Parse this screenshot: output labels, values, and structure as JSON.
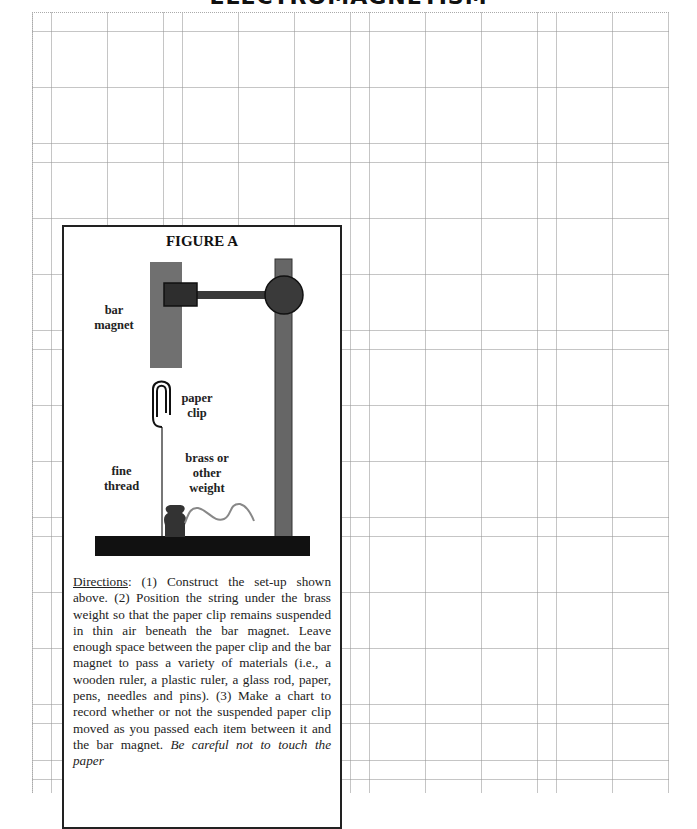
{
  "page": {
    "title": "ELECTROMAGNETISM"
  },
  "figure": {
    "title": "FIGURE A",
    "labels": {
      "bar_magnet_1": "bar",
      "bar_magnet_2": "magnet",
      "paper_clip_1": "paper",
      "paper_clip_2": "clip",
      "fine_thread_1": "fine",
      "fine_thread_2": "thread",
      "weight_1": "brass or",
      "weight_2": "other",
      "weight_3": "weight"
    },
    "colors": {
      "magnet": "#6e6e6e",
      "clamp": "#2e2e2e",
      "stand": "#666666",
      "base": "#111111",
      "weight": "#333333",
      "thread": "#777777"
    }
  },
  "directions": {
    "heading": "Directions",
    "after_heading": ": (1) Construct the set-up shown above. (2) Position the string under the brass weight so that the paper clip remains suspended in thin air beneath the bar magnet. Leave enough space between the paper clip and the bar magnet to pass a variety of materials (i.e., a wooden ruler, a plastic ruler, a glass rod, paper, pens, needles and pins). (3) Make a chart to record whether or not the suspended paper clip moved as you passed each item between it and the bar magnet. ",
    "italic_note": "Be careful not to touch the paper"
  }
}
